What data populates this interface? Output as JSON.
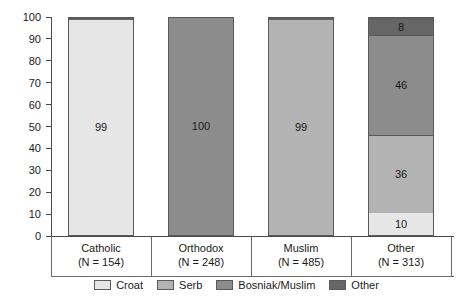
{
  "chart_data": {
    "type": "bar",
    "subtype": "stacked-100-percent",
    "title": "",
    "subtitle": "",
    "xlabel": "",
    "ylabel": "",
    "ylim": [
      0,
      100
    ],
    "yticks": [
      0,
      10,
      20,
      30,
      40,
      50,
      60,
      70,
      80,
      90,
      100
    ],
    "ytick_labels": [
      "0",
      "10",
      "20",
      "30",
      "40",
      "50",
      "60",
      "70",
      "80",
      "90",
      "100"
    ],
    "grid": false,
    "legend_position": "bottom",
    "categories": [
      "Catholic",
      "Orthodox",
      "Muslim",
      "Other"
    ],
    "category_sublabels": [
      "(N = 154)",
      "(N = 248)",
      "(N = 485)",
      "(N = 313)"
    ],
    "category_counts": [
      154,
      248,
      485,
      313
    ],
    "series": [
      {
        "name": "Croat",
        "color": "#e6e6e6",
        "values": [
          99,
          0,
          0,
          10
        ]
      },
      {
        "name": "Serb",
        "color": "#b3b3b3",
        "values": [
          0,
          0,
          99,
          36
        ]
      },
      {
        "name": "Bosniak/Muslim",
        "color": "#8c8c8c",
        "values": [
          0,
          100,
          0,
          46
        ]
      },
      {
        "name": "Other",
        "color": "#666666",
        "values": [
          1,
          0,
          1,
          8
        ]
      }
    ],
    "bars": [
      {
        "category": "Catholic",
        "sublabel": "(N = 154)",
        "segments": [
          {
            "series": "Croat",
            "value": 99,
            "label": "99",
            "show_label": true,
            "color": "#e6e6e6"
          },
          {
            "series": "Other",
            "value": 1,
            "label": "",
            "show_label": false,
            "color": "#666666"
          }
        ]
      },
      {
        "category": "Orthodox",
        "sublabel": "(N = 248)",
        "segments": [
          {
            "series": "Bosniak/Muslim",
            "value": 100,
            "label": "100",
            "show_label": true,
            "color": "#8c8c8c"
          }
        ]
      },
      {
        "category": "Muslim",
        "sublabel": "(N = 485)",
        "segments": [
          {
            "series": "Serb",
            "value": 99,
            "label": "99",
            "show_label": true,
            "color": "#b3b3b3"
          },
          {
            "series": "Other",
            "value": 1,
            "label": "",
            "show_label": false,
            "color": "#666666"
          }
        ]
      },
      {
        "category": "Other",
        "sublabel": "(N = 313)",
        "segments": [
          {
            "series": "Croat",
            "value": 10,
            "label": "10",
            "show_label": true,
            "color": "#e6e6e6"
          },
          {
            "series": "Serb",
            "value": 36,
            "label": "36",
            "show_label": true,
            "color": "#b3b3b3"
          },
          {
            "series": "Bosniak/Muslim",
            "value": 46,
            "label": "46",
            "show_label": true,
            "color": "#8c8c8c"
          },
          {
            "series": "Other",
            "value": 8,
            "label": "8",
            "show_label": true,
            "color": "#666666"
          }
        ]
      }
    ],
    "legend": [
      {
        "label": "Croat",
        "color": "#e6e6e6"
      },
      {
        "label": "Serb",
        "color": "#b3b3b3"
      },
      {
        "label": "Bosniak/Muslim",
        "color": "#8c8c8c"
      },
      {
        "label": "Other",
        "color": "#666666"
      }
    ]
  },
  "style": {
    "axis_color": "#4a4a4a",
    "bar_border_color": "#5a5a5a",
    "text_color": "#1a1a1a",
    "background": "#ffffff"
  }
}
